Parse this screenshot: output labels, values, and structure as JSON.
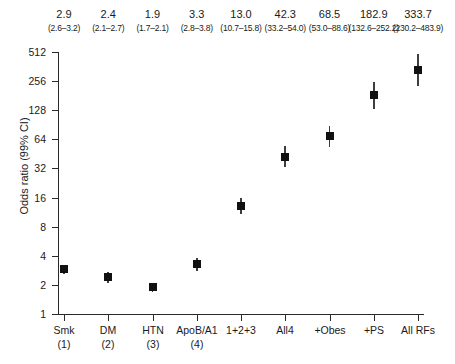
{
  "chart_data": {
    "type": "scatter",
    "title": "",
    "xlabel": "",
    "ylabel": "Odds ratio (99% CI)",
    "yscale": "log2",
    "ylim": [
      1,
      512
    ],
    "ytick_labels": [
      "512",
      "256",
      "128",
      "64",
      "32",
      "16",
      "8",
      "4",
      "2",
      "1"
    ],
    "ytick_values": [
      512,
      256,
      128,
      64,
      32,
      16,
      8,
      4,
      2,
      1
    ],
    "grid": false,
    "legend": "none",
    "categories": [
      "Smk\n(1)",
      "DM\n(2)",
      "HTN\n(3)",
      "ApoB/A1\n(4)",
      "1+2+3",
      "All4",
      "+Obes",
      "+PS",
      "All RFs"
    ],
    "values": [
      2.9,
      2.4,
      1.9,
      3.3,
      13.0,
      42.3,
      68.5,
      182.9,
      333.7
    ],
    "ci_lower": [
      2.6,
      2.1,
      1.7,
      2.8,
      10.7,
      33.2,
      53.0,
      132.6,
      230.2
    ],
    "ci_upper": [
      3.2,
      2.7,
      2.1,
      3.8,
      15.8,
      54.0,
      88.6,
      252.2,
      483.9
    ]
  },
  "axes": {
    "y_title": "Odds ratio (99% CI)",
    "y_ticks": [
      {
        "label": "512"
      },
      {
        "label": "256"
      },
      {
        "label": "128"
      },
      {
        "label": "64"
      },
      {
        "label": "32"
      },
      {
        "label": "16"
      },
      {
        "label": "8"
      },
      {
        "label": "4"
      },
      {
        "label": "2"
      },
      {
        "label": "1"
      }
    ],
    "x_ticks": [
      {
        "label": "Smk",
        "sub": "(1)"
      },
      {
        "label": "DM",
        "sub": "(2)"
      },
      {
        "label": "HTN",
        "sub": "(3)"
      },
      {
        "label": "ApoB/A1",
        "sub": "(4)"
      },
      {
        "label": "1+2+3",
        "sub": ""
      },
      {
        "label": "All4",
        "sub": ""
      },
      {
        "label": "+Obes",
        "sub": ""
      },
      {
        "label": "+PS",
        "sub": ""
      },
      {
        "label": "All RFs",
        "sub": ""
      }
    ]
  },
  "top_annotations": [
    {
      "or": "2.9",
      "ci": "(2.6–3.2)"
    },
    {
      "or": "2.4",
      "ci": "(2.1–2.7)"
    },
    {
      "or": "1.9",
      "ci": "(1.7–2.1)"
    },
    {
      "or": "3.3",
      "ci": "(2.8–3.8)"
    },
    {
      "or": "13.0",
      "ci": "(10.7–15.8)"
    },
    {
      "or": "42.3",
      "ci": "(33.2–54.0)"
    },
    {
      "or": "68.5",
      "ci": "(53.0–88.6)"
    },
    {
      "or": "182.9",
      "ci": "(132.6–252.2)"
    },
    {
      "or": "333.7",
      "ci": "(230.2–483.9)"
    }
  ],
  "colors": {
    "marker": "#111111",
    "error_bar": "#3d3d3d",
    "axis": "#2a2a2a",
    "text": "#1a1a1a",
    "background": "#ffffff"
  }
}
